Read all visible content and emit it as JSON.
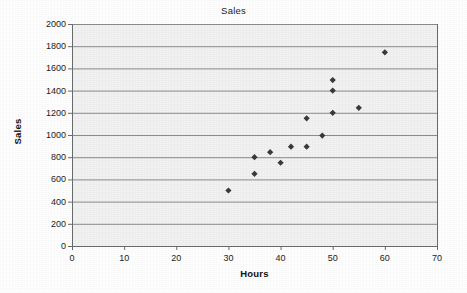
{
  "chart_data": {
    "type": "scatter",
    "title": "Sales",
    "xlabel": "Hours",
    "ylabel": "Sales",
    "xlim": [
      0,
      70
    ],
    "ylim": [
      0,
      2000
    ],
    "xticks": [
      0,
      10,
      20,
      30,
      40,
      50,
      60,
      70
    ],
    "yticks": [
      0,
      200,
      400,
      600,
      800,
      1000,
      1200,
      1400,
      1600,
      1800,
      2000
    ],
    "grid": "horizontal",
    "legend": "none",
    "marker": "diamond",
    "marker_color": "#3a3a3a",
    "plot_background": "#f2f2f2",
    "gridline_color": "#8c8c8c",
    "axis_color": "#6b6b6b",
    "series": [
      {
        "name": "Sales",
        "points": [
          {
            "x": 30,
            "y": 500
          },
          {
            "x": 35,
            "y": 800
          },
          {
            "x": 35,
            "y": 650
          },
          {
            "x": 38,
            "y": 845
          },
          {
            "x": 40,
            "y": 750
          },
          {
            "x": 42,
            "y": 895
          },
          {
            "x": 45,
            "y": 895
          },
          {
            "x": 45,
            "y": 1150
          },
          {
            "x": 48,
            "y": 995
          },
          {
            "x": 50,
            "y": 1200
          },
          {
            "x": 50,
            "y": 1400
          },
          {
            "x": 50,
            "y": 1495
          },
          {
            "x": 55,
            "y": 1245
          },
          {
            "x": 60,
            "y": 1745
          }
        ]
      }
    ]
  }
}
